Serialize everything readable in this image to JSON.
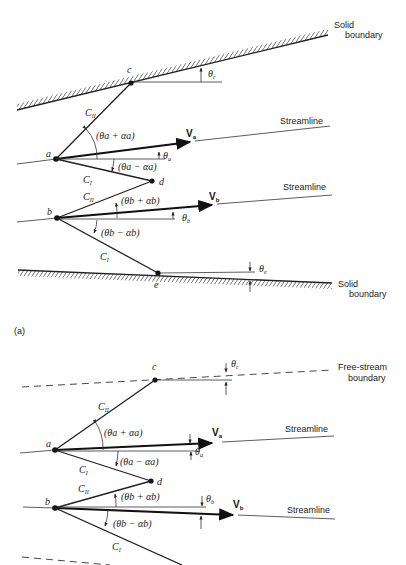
{
  "figure": {
    "panel_a": {
      "label": "(a)",
      "top_boundary": {
        "line1": "Solid",
        "line2": "boundary"
      },
      "bottom_boundary": {
        "line1": "Solid",
        "line2": "boundary"
      },
      "streamline_a": "Streamline",
      "streamline_b": "Streamline",
      "points": {
        "a": "a",
        "b": "b",
        "c": "c",
        "d": "d",
        "e": "e"
      },
      "characteristics": {
        "c2": "C",
        "c2_sub": "II",
        "c1": "C",
        "c1_sub": "I"
      },
      "velocities": {
        "va": "V",
        "va_sub": "a",
        "vb": "V",
        "vb_sub": "b"
      },
      "angles": {
        "theta_c": "θ",
        "theta_c_sub": "c",
        "theta_a": "θ",
        "theta_a_sub": "a",
        "theta_b": "θ",
        "theta_b_sub": "b",
        "theta_e": "θ",
        "theta_e_sub": "e",
        "a_plus": "(θa + αa)",
        "a_minus": "(θa − αa)",
        "b_plus": "(θb + αb)",
        "b_minus": "(θb − αb)"
      }
    },
    "panel_b": {
      "top_boundary": {
        "line1": "Free-stream",
        "line2": "boundary"
      },
      "streamline_a": "Streamline",
      "streamline_b": "Streamline",
      "points": {
        "a": "a",
        "b": "b",
        "c": "c",
        "d": "d"
      },
      "characteristics": {
        "c2": "C",
        "c2_sub": "II",
        "c1": "C",
        "c1_sub": "I"
      },
      "velocities": {
        "va": "V",
        "va_sub": "a",
        "vb": "V",
        "vb_sub": "b"
      },
      "angles": {
        "theta_c": "θ",
        "theta_c_sub": "c",
        "theta_a": "θ",
        "theta_a_sub": "a",
        "theta_b": "θ",
        "theta_b_sub": "b",
        "a_plus": "(θa + αa)",
        "a_minus": "(θa − αa)",
        "b_plus": "(θb + αb)",
        "b_minus": "(θb − αb)"
      }
    }
  }
}
